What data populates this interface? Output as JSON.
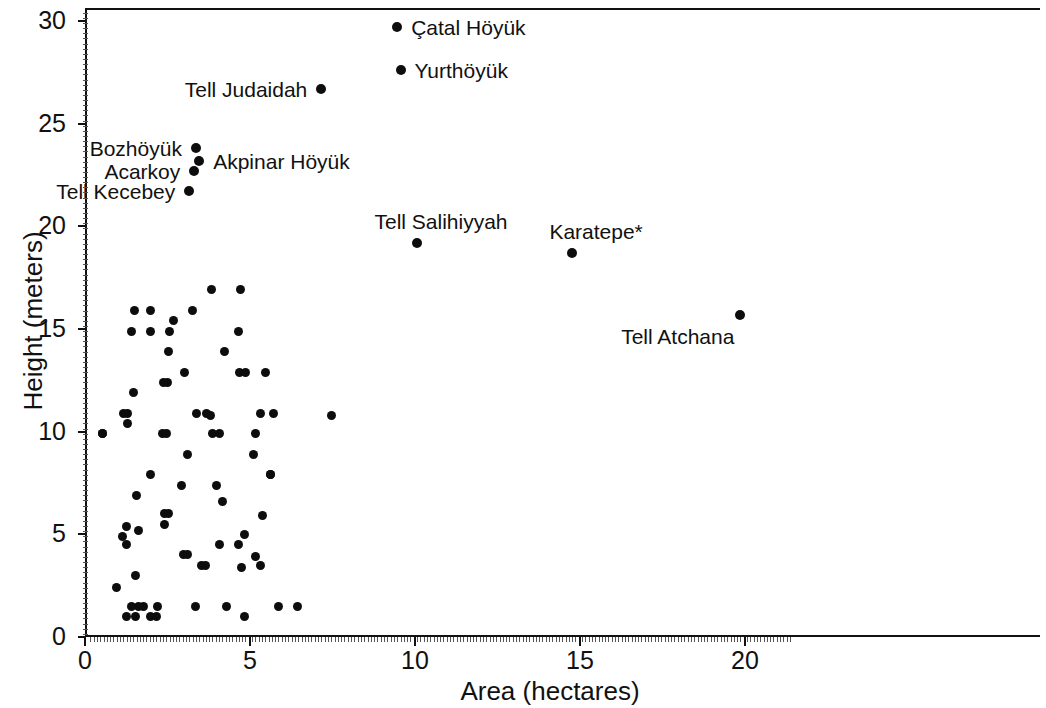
{
  "chart_data": {
    "type": "scatter",
    "title": "",
    "xlabel": "Area (hectares)",
    "ylabel": "Height (meters)",
    "xlim": [
      0,
      21.4
    ],
    "ylim": [
      0,
      30.6
    ],
    "xticks": [
      0,
      5,
      10,
      15,
      20
    ],
    "yticks": [
      0,
      5,
      10,
      15,
      20,
      25,
      30
    ],
    "xtick_labels": [
      "0",
      "5",
      "10",
      "15",
      "20"
    ],
    "ytick_labels": [
      "0",
      "5",
      "10",
      "15",
      "20",
      "25",
      "30"
    ],
    "grid": false,
    "legend": null,
    "marker": "filled-circle",
    "marker_color": "#0d0d0d",
    "labeled_points": [
      {
        "name": "Çatal Höyük",
        "x": 9.4,
        "y": 29.8,
        "label_side": "right"
      },
      {
        "name": "Yurthöyük",
        "x": 9.5,
        "y": 27.7,
        "label_side": "right"
      },
      {
        "name": "Tell Judaidah",
        "x": 7.1,
        "y": 26.8,
        "label_side": "left"
      },
      {
        "name": "Bozhöyük",
        "x": 3.3,
        "y": 23.9,
        "label_side": "left"
      },
      {
        "name": "Akpinar Höyük",
        "x": 3.4,
        "y": 23.3,
        "label_side": "right"
      },
      {
        "name": "Acarkoy",
        "x": 3.25,
        "y": 22.8,
        "label_side": "left"
      },
      {
        "name": "Tell Kecebey",
        "x": 3.1,
        "y": 21.8,
        "label_side": "left"
      },
      {
        "name": "Tell Salihiyyah",
        "x": 10.0,
        "y": 19.3,
        "label_side": "above"
      },
      {
        "name": "Karatepe*",
        "x": 14.7,
        "y": 18.8,
        "label_side": "above"
      },
      {
        "name": "Tell Atchana",
        "x": 19.8,
        "y": 15.8,
        "label_side": "below-left"
      }
    ],
    "unlabeled_points": [
      {
        "x": 0.47,
        "y": 10.0
      },
      {
        "x": 1.45,
        "y": 16.0
      },
      {
        "x": 1.91,
        "y": 16.0
      },
      {
        "x": 1.36,
        "y": 15.0
      },
      {
        "x": 1.92,
        "y": 15.0
      },
      {
        "x": 2.51,
        "y": 15.0
      },
      {
        "x": 2.63,
        "y": 15.5
      },
      {
        "x": 2.47,
        "y": 14.0
      },
      {
        "x": 3.76,
        "y": 17.0
      },
      {
        "x": 3.2,
        "y": 16.0
      },
      {
        "x": 4.6,
        "y": 15.0
      },
      {
        "x": 4.16,
        "y": 14.0
      },
      {
        "x": 2.95,
        "y": 13.0
      },
      {
        "x": 1.41,
        "y": 12.0
      },
      {
        "x": 2.43,
        "y": 12.5
      },
      {
        "x": 4.64,
        "y": 17.0
      },
      {
        "x": 1.1,
        "y": 11.0
      },
      {
        "x": 1.23,
        "y": 11.0
      },
      {
        "x": 1.22,
        "y": 10.5
      },
      {
        "x": 3.33,
        "y": 11.0
      },
      {
        "x": 3.62,
        "y": 11.0
      },
      {
        "x": 3.75,
        "y": 10.9
      },
      {
        "x": 0.48,
        "y": 10.0
      },
      {
        "x": 2.3,
        "y": 10.0
      },
      {
        "x": 2.42,
        "y": 10.0
      },
      {
        "x": 3.8,
        "y": 10.0
      },
      {
        "x": 4.63,
        "y": 13.0
      },
      {
        "x": 4.8,
        "y": 13.0
      },
      {
        "x": 5.4,
        "y": 13.0
      },
      {
        "x": 5.65,
        "y": 11.0
      },
      {
        "x": 5.25,
        "y": 11.0
      },
      {
        "x": 5.1,
        "y": 10.0
      },
      {
        "x": 7.4,
        "y": 10.9
      },
      {
        "x": 1.93,
        "y": 8.0
      },
      {
        "x": 2.33,
        "y": 12.5
      },
      {
        "x": 1.5,
        "y": 7.0
      },
      {
        "x": 1.19,
        "y": 5.5
      },
      {
        "x": 1.55,
        "y": 5.3
      },
      {
        "x": 1.08,
        "y": 5.0
      },
      {
        "x": 2.34,
        "y": 6.1
      },
      {
        "x": 1.19,
        "y": 4.6
      },
      {
        "x": 2.34,
        "y": 5.6
      },
      {
        "x": 2.93,
        "y": 4.1
      },
      {
        "x": 3.04,
        "y": 4.1
      },
      {
        "x": 4.02,
        "y": 4.6
      },
      {
        "x": 3.48,
        "y": 3.6
      },
      {
        "x": 3.58,
        "y": 3.6
      },
      {
        "x": 4.6,
        "y": 4.6
      },
      {
        "x": 4.67,
        "y": 3.5
      },
      {
        "x": 1.46,
        "y": 3.1
      },
      {
        "x": 0.89,
        "y": 2.5
      },
      {
        "x": 1.34,
        "y": 1.6
      },
      {
        "x": 1.57,
        "y": 1.6
      },
      {
        "x": 1.7,
        "y": 1.6
      },
      {
        "x": 2.15,
        "y": 1.6
      },
      {
        "x": 1.46,
        "y": 1.1
      },
      {
        "x": 1.21,
        "y": 1.1
      },
      {
        "x": 1.92,
        "y": 1.1
      },
      {
        "x": 2.12,
        "y": 1.1
      },
      {
        "x": 3.28,
        "y": 1.6
      },
      {
        "x": 4.24,
        "y": 1.6
      },
      {
        "x": 5.55,
        "y": 8.0
      },
      {
        "x": 4.0,
        "y": 10.0
      },
      {
        "x": 5.55,
        "y": 8.0
      },
      {
        "x": 3.92,
        "y": 7.5
      },
      {
        "x": 4.12,
        "y": 6.7
      },
      {
        "x": 2.46,
        "y": 6.1
      },
      {
        "x": 5.33,
        "y": 6.0
      },
      {
        "x": 4.78,
        "y": 5.1
      },
      {
        "x": 5.1,
        "y": 4.0
      },
      {
        "x": 5.25,
        "y": 3.6
      },
      {
        "x": 5.8,
        "y": 1.6
      },
      {
        "x": 6.37,
        "y": 1.6
      },
      {
        "x": 4.77,
        "y": 1.1
      },
      {
        "x": 2.85,
        "y": 7.5
      },
      {
        "x": 5.05,
        "y": 9.0
      },
      {
        "x": 3.05,
        "y": 9.0
      }
    ]
  },
  "axis": {
    "x_title": "Area (hectares)",
    "y_title": "Height (meters)"
  }
}
